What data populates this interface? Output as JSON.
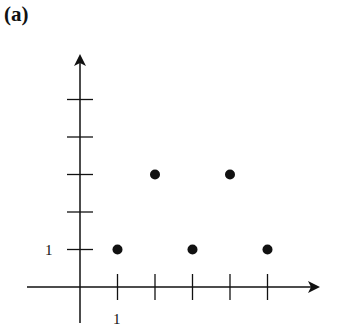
{
  "panel_label": "(a)",
  "chart_data": {
    "type": "scatter",
    "title": "",
    "xlabel": "",
    "ylabel": "",
    "x_tick_labels": [
      "1"
    ],
    "y_tick_labels": [
      "1"
    ],
    "x_ticks": [
      1,
      2,
      3,
      4,
      5
    ],
    "y_ticks": [
      1,
      2,
      3,
      4,
      5
    ],
    "xlim": [
      -1.4,
      6.1
    ],
    "ylim": [
      -1,
      6
    ],
    "grid": false,
    "legend": null,
    "series": [
      {
        "name": "points",
        "x": [
          1,
          2,
          3,
          4,
          5
        ],
        "y": [
          1,
          3,
          1,
          3,
          1
        ]
      }
    ]
  },
  "colors": {
    "ink": "#111111",
    "background": "#ffffff"
  }
}
